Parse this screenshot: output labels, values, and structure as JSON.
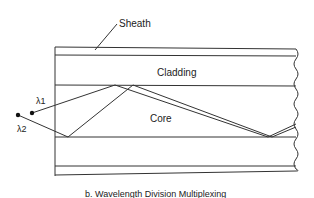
{
  "diagram": {
    "labels": {
      "sheath": "Sheath",
      "cladding": "Cladding",
      "core": "Core",
      "lambda1": "λ1",
      "lambda2": "λ2"
    },
    "caption": "b. Wavelength Division Multiplexing",
    "colors": {
      "line": "#333333",
      "background": "#ffffff"
    }
  }
}
